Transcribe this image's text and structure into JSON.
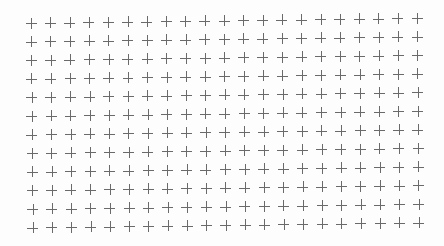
{
  "grid": {
    "columns": 21,
    "rows": 12,
    "origin": {
      "x": 31,
      "y": 23
    },
    "col_step": {
      "dx": 19.3,
      "dy": -0.25
    },
    "row_step": {
      "dx": 0.15,
      "dy": 18.6
    },
    "cross_half_size": 5.5,
    "cross_color": "#6a6a6a",
    "background_color": "#fdfdfd",
    "glyph": "plus-icon"
  }
}
